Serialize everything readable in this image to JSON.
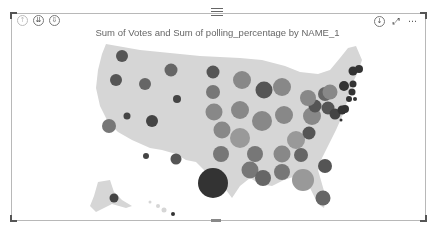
{
  "visual": {
    "title": "Sum of Votes and Sum of polling_percentage by NAME_1",
    "header_icons_left": [
      {
        "name": "drill-up-icon",
        "glyph": "↑"
      },
      {
        "name": "expand-all-icon",
        "glyph": "⇊"
      },
      {
        "name": "drill-mode-icon",
        "glyph": "⇩"
      }
    ],
    "header_icons_right": [
      {
        "name": "download-icon",
        "glyph": "↓"
      },
      {
        "name": "focus-mode-icon",
        "glyph": "⤢"
      },
      {
        "name": "more-options-icon",
        "glyph": "⋯"
      }
    ]
  },
  "colors": {
    "map_fill": "#d6d6d6",
    "bubble_dark": "#3a3a3a",
    "bubble_mid": "#6e6e6e",
    "bubble_light": "#999999",
    "frame": "#b8b8b8"
  }
}
